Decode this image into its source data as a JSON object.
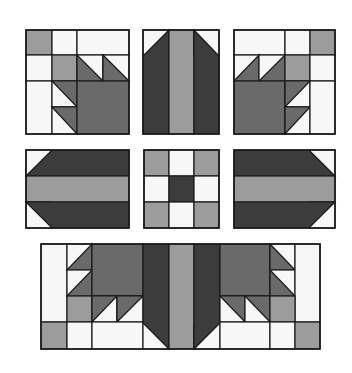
{
  "colors": {
    "white": "#f7f7f7",
    "light": "#9c9c9c",
    "medium": "#6a6a6a",
    "dark": "#3c3c3c",
    "line": "#1a1a1a"
  },
  "blocks": [
    {
      "name": "block-top-left-bear-paw",
      "frame": [
        26,
        30,
        103,
        104
      ],
      "shapes": [
        {
          "t": "r",
          "c": "light",
          "p": [
            26,
            30,
            26,
            25
          ]
        },
        {
          "t": "r",
          "c": "white",
          "p": [
            52,
            30,
            25,
            25
          ]
        },
        {
          "t": "r",
          "c": "white",
          "p": [
            77,
            30,
            52,
            25
          ]
        },
        {
          "t": "r",
          "c": "white",
          "p": [
            26,
            55,
            26,
            26
          ]
        },
        {
          "t": "r",
          "c": "light",
          "p": [
            52,
            55,
            25,
            26
          ]
        },
        {
          "t": "r",
          "c": "white",
          "p": [
            77,
            55,
            26,
            26
          ]
        },
        {
          "t": "p",
          "c": "medium",
          "p": [
            [
              77,
              55
            ],
            [
              77,
              81
            ],
            [
              103,
              81
            ]
          ]
        },
        {
          "t": "r",
          "c": "white",
          "p": [
            103,
            55,
            26,
            26
          ]
        },
        {
          "t": "p",
          "c": "medium",
          "p": [
            [
              103,
              55
            ],
            [
              103,
              81
            ],
            [
              129,
              81
            ]
          ]
        },
        {
          "t": "r",
          "c": "white",
          "p": [
            26,
            81,
            26,
            53
          ]
        },
        {
          "t": "r",
          "c": "white",
          "p": [
            52,
            81,
            25,
            26
          ]
        },
        {
          "t": "p",
          "c": "medium",
          "p": [
            [
              52,
              81
            ],
            [
              77,
              81
            ],
            [
              77,
              107
            ]
          ]
        },
        {
          "t": "r",
          "c": "white",
          "p": [
            52,
            107,
            25,
            27
          ]
        },
        {
          "t": "p",
          "c": "medium",
          "p": [
            [
              52,
              107
            ],
            [
              77,
              107
            ],
            [
              77,
              134
            ]
          ]
        },
        {
          "t": "r",
          "c": "medium",
          "p": [
            77,
            81,
            52,
            53
          ]
        }
      ]
    },
    {
      "name": "block-top-center-strips",
      "frame": [
        143,
        30,
        76,
        104
      ],
      "shapes": [
        {
          "t": "r",
          "c": "white",
          "p": [
            143,
            30,
            26,
            26
          ]
        },
        {
          "t": "p",
          "c": "dark",
          "p": [
            [
              169,
              30
            ],
            [
              169,
              134
            ],
            [
              143,
              134
            ],
            [
              143,
              56
            ]
          ]
        },
        {
          "t": "r",
          "c": "light",
          "p": [
            169,
            30,
            25,
            104
          ]
        },
        {
          "t": "r",
          "c": "white",
          "p": [
            194,
            30,
            25,
            26
          ]
        },
        {
          "t": "p",
          "c": "dark",
          "p": [
            [
              194,
              30
            ],
            [
              194,
              134
            ],
            [
              219,
              134
            ],
            [
              219,
              56
            ]
          ]
        }
      ]
    },
    {
      "name": "block-top-right-bear-paw",
      "frame": [
        234,
        30,
        101,
        104
      ],
      "shapes": [
        {
          "t": "r",
          "c": "white",
          "p": [
            234,
            30,
            51,
            25
          ]
        },
        {
          "t": "r",
          "c": "white",
          "p": [
            285,
            30,
            25,
            25
          ]
        },
        {
          "t": "r",
          "c": "light",
          "p": [
            310,
            30,
            25,
            25
          ]
        },
        {
          "t": "r",
          "c": "white",
          "p": [
            234,
            55,
            25,
            26
          ]
        },
        {
          "t": "p",
          "c": "medium",
          "p": [
            [
              259,
              55
            ],
            [
              259,
              81
            ],
            [
              234,
              81
            ]
          ]
        },
        {
          "t": "r",
          "c": "white",
          "p": [
            259,
            55,
            26,
            26
          ]
        },
        {
          "t": "p",
          "c": "medium",
          "p": [
            [
              285,
              55
            ],
            [
              285,
              81
            ],
            [
              259,
              81
            ]
          ]
        },
        {
          "t": "r",
          "c": "light",
          "p": [
            285,
            55,
            25,
            26
          ]
        },
        {
          "t": "r",
          "c": "white",
          "p": [
            310,
            55,
            25,
            26
          ]
        },
        {
          "t": "r",
          "c": "medium",
          "p": [
            234,
            81,
            51,
            53
          ]
        },
        {
          "t": "r",
          "c": "white",
          "p": [
            285,
            81,
            25,
            26
          ]
        },
        {
          "t": "p",
          "c": "medium",
          "p": [
            [
              285,
              81
            ],
            [
              310,
              81
            ],
            [
              285,
              107
            ]
          ]
        },
        {
          "t": "r",
          "c": "white",
          "p": [
            285,
            107,
            25,
            27
          ]
        },
        {
          "t": "p",
          "c": "medium",
          "p": [
            [
              285,
              107
            ],
            [
              310,
              107
            ],
            [
              285,
              134
            ]
          ]
        },
        {
          "t": "r",
          "c": "white",
          "p": [
            310,
            81,
            25,
            53
          ]
        }
      ]
    },
    {
      "name": "block-middle-left-strips",
      "frame": [
        26,
        150,
        103,
        78
      ],
      "shapes": [
        {
          "t": "r",
          "c": "white",
          "p": [
            26,
            150,
            26,
            26
          ]
        },
        {
          "t": "p",
          "c": "dark",
          "p": [
            [
              52,
              150
            ],
            [
              129,
              150
            ],
            [
              129,
              176
            ],
            [
              26,
              176
            ]
          ]
        },
        {
          "t": "r",
          "c": "light",
          "p": [
            26,
            176,
            103,
            26
          ]
        },
        {
          "t": "r",
          "c": "white",
          "p": [
            26,
            202,
            26,
            26
          ]
        },
        {
          "t": "p",
          "c": "dark",
          "p": [
            [
              26,
              202
            ],
            [
              129,
              202
            ],
            [
              129,
              228
            ],
            [
              52,
              228
            ]
          ]
        }
      ]
    },
    {
      "name": "block-center-nine-patch",
      "frame": [
        144,
        150,
        75,
        78
      ],
      "shapes": [
        {
          "t": "r",
          "c": "light",
          "p": [
            144,
            150,
            25,
            26
          ]
        },
        {
          "t": "r",
          "c": "white",
          "p": [
            169,
            150,
            25,
            26
          ]
        },
        {
          "t": "r",
          "c": "light",
          "p": [
            194,
            150,
            25,
            26
          ]
        },
        {
          "t": "r",
          "c": "white",
          "p": [
            144,
            176,
            25,
            26
          ]
        },
        {
          "t": "r",
          "c": "dark",
          "p": [
            169,
            176,
            25,
            26
          ]
        },
        {
          "t": "r",
          "c": "white",
          "p": [
            194,
            176,
            25,
            26
          ]
        },
        {
          "t": "r",
          "c": "light",
          "p": [
            144,
            202,
            25,
            26
          ]
        },
        {
          "t": "r",
          "c": "white",
          "p": [
            169,
            202,
            25,
            26
          ]
        },
        {
          "t": "r",
          "c": "light",
          "p": [
            194,
            202,
            25,
            26
          ]
        }
      ]
    },
    {
      "name": "block-middle-right-strips",
      "frame": [
        234,
        150,
        101,
        78
      ],
      "shapes": [
        {
          "t": "r",
          "c": "white",
          "p": [
            309,
            150,
            26,
            26
          ]
        },
        {
          "t": "p",
          "c": "dark",
          "p": [
            [
              234,
              150
            ],
            [
              309,
              150
            ],
            [
              335,
              176
            ],
            [
              234,
              176
            ]
          ]
        },
        {
          "t": "r",
          "c": "light",
          "p": [
            234,
            176,
            101,
            26
          ]
        },
        {
          "t": "r",
          "c": "white",
          "p": [
            309,
            202,
            26,
            26
          ]
        },
        {
          "t": "p",
          "c": "dark",
          "p": [
            [
              234,
              202
            ],
            [
              335,
              202
            ],
            [
              309,
              228
            ],
            [
              234,
              228
            ]
          ]
        }
      ]
    },
    {
      "name": "block-bottom-assembled-row",
      "frame": [
        41,
        244,
        279,
        105
      ],
      "shapes": [
        {
          "t": "r",
          "c": "white",
          "p": [
            41,
            244,
            26,
            78
          ]
        },
        {
          "t": "r",
          "c": "light",
          "p": [
            41,
            322,
            26,
            27
          ]
        },
        {
          "t": "r",
          "c": "white",
          "p": [
            67,
            244,
            25,
            26
          ]
        },
        {
          "t": "p",
          "c": "medium",
          "p": [
            [
              92,
              244
            ],
            [
              92,
              270
            ],
            [
              67,
              270
            ]
          ]
        },
        {
          "t": "r",
          "c": "white",
          "p": [
            67,
            270,
            25,
            26
          ]
        },
        {
          "t": "p",
          "c": "medium",
          "p": [
            [
              92,
              270
            ],
            [
              92,
              296
            ],
            [
              67,
              296
            ]
          ]
        },
        {
          "t": "r",
          "c": "light",
          "p": [
            67,
            296,
            25,
            26
          ]
        },
        {
          "t": "r",
          "c": "white",
          "p": [
            67,
            322,
            25,
            27
          ]
        },
        {
          "t": "r",
          "c": "medium",
          "p": [
            92,
            244,
            51,
            52
          ]
        },
        {
          "t": "r",
          "c": "white",
          "p": [
            92,
            296,
            25,
            26
          ]
        },
        {
          "t": "p",
          "c": "medium",
          "p": [
            [
              92,
              296
            ],
            [
              117,
              296
            ],
            [
              92,
              322
            ]
          ]
        },
        {
          "t": "r",
          "c": "white",
          "p": [
            117,
            296,
            26,
            26
          ]
        },
        {
          "t": "p",
          "c": "medium",
          "p": [
            [
              117,
              296
            ],
            [
              143,
              296
            ],
            [
              117,
              322
            ]
          ]
        },
        {
          "t": "r",
          "c": "white",
          "p": [
            92,
            322,
            51,
            27
          ]
        },
        {
          "t": "r",
          "c": "white",
          "p": [
            143,
            323,
            26,
            26
          ]
        },
        {
          "t": "p",
          "c": "dark",
          "p": [
            [
              143,
              244
            ],
            [
              169,
              244
            ],
            [
              169,
              349
            ],
            [
              143,
              323
            ]
          ]
        },
        {
          "t": "r",
          "c": "light",
          "p": [
            169,
            244,
            25,
            105
          ]
        },
        {
          "t": "r",
          "c": "white",
          "p": [
            194,
            323,
            26,
            26
          ]
        },
        {
          "t": "p",
          "c": "dark",
          "p": [
            [
              194,
              244
            ],
            [
              220,
              244
            ],
            [
              220,
              323
            ],
            [
              194,
              349
            ]
          ]
        },
        {
          "t": "r",
          "c": "medium",
          "p": [
            220,
            244,
            50,
            52
          ]
        },
        {
          "t": "r",
          "c": "white",
          "p": [
            270,
            244,
            25,
            26
          ]
        },
        {
          "t": "p",
          "c": "medium",
          "p": [
            [
              270,
              244
            ],
            [
              295,
              270
            ],
            [
              270,
              270
            ]
          ]
        },
        {
          "t": "r",
          "c": "white",
          "p": [
            270,
            270,
            25,
            26
          ]
        },
        {
          "t": "p",
          "c": "medium",
          "p": [
            [
              270,
              270
            ],
            [
              295,
              296
            ],
            [
              270,
              296
            ]
          ]
        },
        {
          "t": "r",
          "c": "white",
          "p": [
            295,
            244,
            25,
            78
          ]
        },
        {
          "t": "r",
          "c": "white",
          "p": [
            220,
            296,
            25,
            26
          ]
        },
        {
          "t": "p",
          "c": "medium",
          "p": [
            [
              220,
              296
            ],
            [
              245,
              296
            ],
            [
              245,
              322
            ]
          ]
        },
        {
          "t": "r",
          "c": "white",
          "p": [
            245,
            296,
            25,
            26
          ]
        },
        {
          "t": "p",
          "c": "medium",
          "p": [
            [
              245,
              296
            ],
            [
              270,
              296
            ],
            [
              270,
              322
            ]
          ]
        },
        {
          "t": "r",
          "c": "light",
          "p": [
            270,
            296,
            25,
            26
          ]
        },
        {
          "t": "r",
          "c": "white",
          "p": [
            220,
            322,
            50,
            27
          ]
        },
        {
          "t": "r",
          "c": "white",
          "p": [
            270,
            322,
            25,
            27
          ]
        },
        {
          "t": "r",
          "c": "light",
          "p": [
            295,
            322,
            25,
            27
          ]
        }
      ]
    }
  ]
}
